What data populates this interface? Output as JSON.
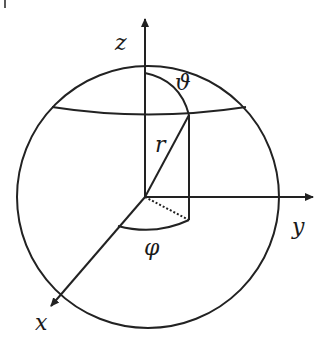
{
  "figure": {
    "labels": {
      "z_axis": "z",
      "y_axis": "y",
      "x_axis": "x",
      "radius": "r",
      "polar_angle": "ϑ",
      "azimuth_angle": "φ"
    },
    "colors": {
      "stroke": "#222222",
      "background": "#ffffff"
    }
  }
}
